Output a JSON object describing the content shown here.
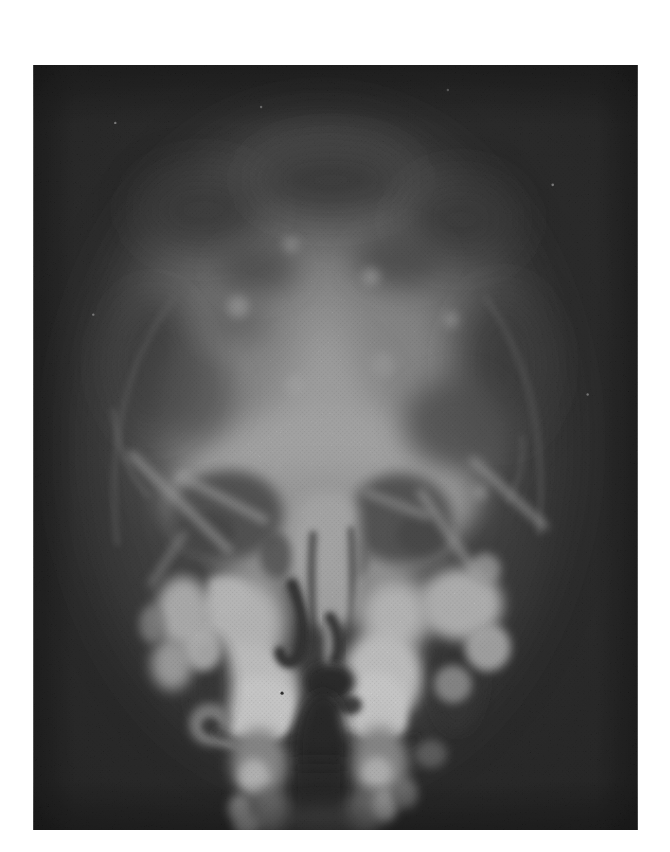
{
  "figure": {
    "type": "radiograph-halftone-print",
    "features": [
      "cranial vault with mottled bone texture",
      "bright central frontal bone region",
      "left and right orbits (dark sockets)",
      "nasal septum and turbinates",
      "bright maxillary and upper-teeth masses",
      "mastoid and petrous bone clusters",
      "dark oral/pharyngeal midline column",
      "cervical spine shadows at bottom"
    ]
  },
  "palette": {
    "page_background": "#ffffff",
    "film_dark": "#1e1e1e",
    "film_corner": "#141414",
    "bone_midtone": "#9a9a9a",
    "bone_bright": "#f3f3f3",
    "orbit_shadow": "#565656"
  },
  "layout_px": {
    "frame": {
      "left": 33,
      "top": 65,
      "width": 605,
      "height": 765
    }
  }
}
